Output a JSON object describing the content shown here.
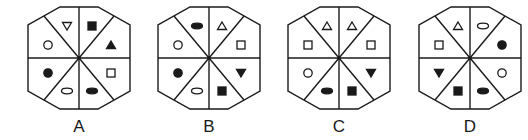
{
  "colors": {
    "stroke": "#1a1a1a",
    "background": "#ffffff"
  },
  "octagon": {
    "half_width": 51,
    "half_height": 51,
    "corner_x": 19,
    "corner_y": 33,
    "cy": 58
  },
  "options": [
    {
      "label": "A",
      "cx": 79,
      "sectors": [
        {
          "position": "top-left",
          "shape": "triangle-down",
          "filled": false
        },
        {
          "position": "top-right",
          "shape": "square",
          "filled": true
        },
        {
          "position": "right-top",
          "shape": "triangle-up",
          "filled": true
        },
        {
          "position": "right-bottom",
          "shape": "square",
          "filled": false
        },
        {
          "position": "bottom-right",
          "shape": "ellipse",
          "filled": true
        },
        {
          "position": "bottom-left",
          "shape": "ellipse",
          "filled": false
        },
        {
          "position": "left-bottom",
          "shape": "circle",
          "filled": true
        },
        {
          "position": "left-top",
          "shape": "circle",
          "filled": false
        }
      ]
    },
    {
      "label": "B",
      "cx": 209,
      "sectors": [
        {
          "position": "top-left",
          "shape": "ellipse",
          "filled": true
        },
        {
          "position": "top-right",
          "shape": "triangle-up",
          "filled": false
        },
        {
          "position": "right-top",
          "shape": "square",
          "filled": false
        },
        {
          "position": "right-bottom",
          "shape": "triangle-down",
          "filled": true
        },
        {
          "position": "bottom-right",
          "shape": "square",
          "filled": true
        },
        {
          "position": "bottom-left",
          "shape": "ellipse",
          "filled": false
        },
        {
          "position": "left-bottom",
          "shape": "circle",
          "filled": true
        },
        {
          "position": "left-top",
          "shape": "circle",
          "filled": false
        }
      ]
    },
    {
      "label": "C",
      "cx": 339,
      "sectors": [
        {
          "position": "top-left",
          "shape": "triangle-up",
          "filled": false
        },
        {
          "position": "top-right",
          "shape": "triangle-up",
          "filled": false
        },
        {
          "position": "right-top",
          "shape": "square",
          "filled": false
        },
        {
          "position": "right-bottom",
          "shape": "triangle-down",
          "filled": true
        },
        {
          "position": "bottom-right",
          "shape": "square",
          "filled": true
        },
        {
          "position": "bottom-left",
          "shape": "ellipse",
          "filled": true
        },
        {
          "position": "left-bottom",
          "shape": "circle",
          "filled": false
        },
        {
          "position": "left-top",
          "shape": "square",
          "filled": false
        }
      ]
    },
    {
      "label": "D",
      "cx": 470,
      "sectors": [
        {
          "position": "top-left",
          "shape": "triangle-up",
          "filled": false
        },
        {
          "position": "top-right",
          "shape": "ellipse",
          "filled": false
        },
        {
          "position": "right-top",
          "shape": "circle",
          "filled": true
        },
        {
          "position": "right-bottom",
          "shape": "circle",
          "filled": false
        },
        {
          "position": "bottom-right",
          "shape": "ellipse",
          "filled": true
        },
        {
          "position": "bottom-left",
          "shape": "square",
          "filled": true
        },
        {
          "position": "left-bottom",
          "shape": "triangle-down",
          "filled": true
        },
        {
          "position": "left-top",
          "shape": "square",
          "filled": false
        }
      ]
    }
  ]
}
